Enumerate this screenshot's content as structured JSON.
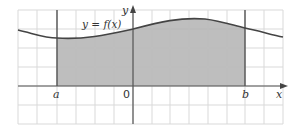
{
  "diagram": {
    "function_label": "y = f(x)",
    "labels": {
      "a": "a",
      "b": "b",
      "origin": "0",
      "x_axis": "x",
      "y_axis": "y"
    },
    "colors": {
      "shading": "#b3b3b3",
      "grid": "#d9d9d9",
      "axes": "#555555",
      "curve": "#444444",
      "bounds": "#555555"
    },
    "grid": {
      "left": 18,
      "right": 283,
      "top": 10,
      "bottom": 124,
      "spacing": 19
    }
  }
}
